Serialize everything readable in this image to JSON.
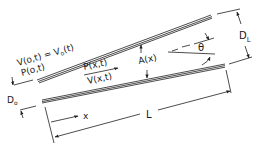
{
  "diagram": {
    "type": "tapered tube schematic",
    "colors": {
      "line": "#1f1f1f",
      "background": "#ffffff"
    },
    "labels": {
      "inlet_velocity": "V(o,t) = V",
      "inlet_velocity_sub": "o",
      "inlet_velocity_tail": "(t)",
      "inlet_pressure": "P(o,t)",
      "pressure_x": "P(x,t)",
      "velocity_x": "V(x,t)",
      "area": "A(x)",
      "angle": "θ",
      "outlet_diameter": "D",
      "outlet_diameter_sub": "L",
      "inlet_diameter": "D",
      "inlet_diameter_sub": "o",
      "position": "x",
      "length": "L"
    }
  }
}
